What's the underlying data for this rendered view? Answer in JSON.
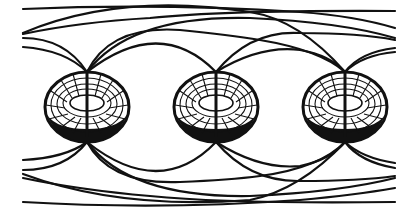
{
  "figure": {
    "background": "#ffffff",
    "ink": "#111111",
    "tori": [
      {
        "id": "torus-1",
        "cx": 87,
        "cy": 107,
        "rx": 42,
        "ry": 36
      },
      {
        "id": "torus-2",
        "cx": 216,
        "cy": 107,
        "rx": 41,
        "ry": 36
      },
      {
        "id": "torus-3",
        "cx": 345,
        "cy": 107,
        "rx": 42,
        "ry": 36
      }
    ],
    "field_lines_count_top": 12,
    "field_lines_count_bottom": 12
  }
}
